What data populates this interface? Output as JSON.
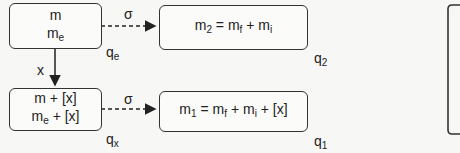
{
  "states": {
    "qe": {
      "line1": "m",
      "line2_base": "m",
      "line2_sub": "e",
      "label_base": "q",
      "label_sub": "e"
    },
    "q2": {
      "lhs_base": "m",
      "lhs_sub": "2",
      "eq": " = ",
      "t1_base": "m",
      "t1_sub": "f",
      "plus": " + ",
      "t2_base": "m",
      "t2_sub": "i",
      "label_base": "q",
      "label_sub": "2"
    },
    "qx": {
      "line1": "m + [x]",
      "line2_base": "m",
      "line2_sub": "e",
      "line2_rest": " + [x]",
      "label_base": "q",
      "label_sub": "x"
    },
    "q1": {
      "lhs_base": "m",
      "lhs_sub": "1",
      "eq": " = ",
      "t1_base": "m",
      "t1_sub": "f",
      "plus": " + ",
      "t2_base": "m",
      "t2_sub": "i",
      "rest": " + [x]",
      "label_base": "q",
      "label_sub": "1"
    }
  },
  "edges": {
    "sigma_top": "σ",
    "sigma_bottom": "σ",
    "x_edge": "x"
  }
}
